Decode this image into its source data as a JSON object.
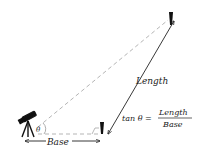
{
  "diagram": {
    "labels": {
      "length": "Length",
      "base": "Base",
      "theta": "θ",
      "formula_prefix": "tan θ =",
      "formula_numerator": "Length",
      "formula_denominator": "Base"
    },
    "elements": {
      "observer": "telescope-on-tripod",
      "near_marker": "near-pole",
      "far_marker": "far-pole"
    },
    "colors": {
      "ink": "#222222",
      "dashed": "#b5b5b5",
      "background": "#ffffff"
    }
  }
}
